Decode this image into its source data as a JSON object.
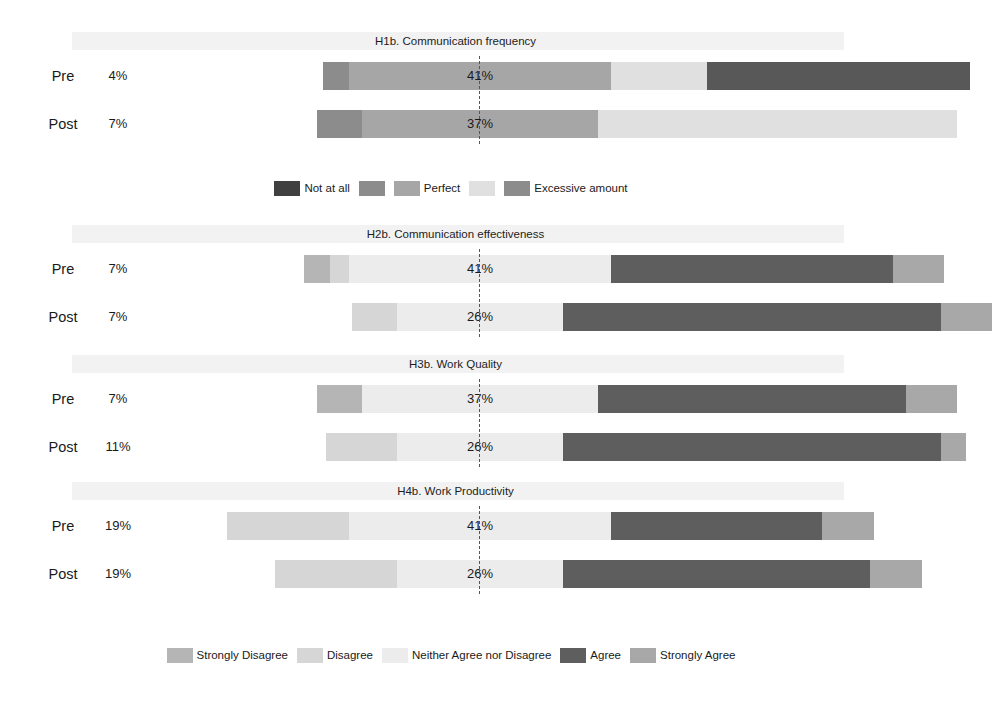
{
  "chart_data": {
    "type": "bar",
    "subtype": "diverging-stacked-likert",
    "title": "",
    "xlabel": "",
    "ylabel": "",
    "grid": false,
    "center_reference": 0,
    "legend_position": "bottom",
    "panels": [
      {
        "title": "H1b. Communication frequency",
        "scale": [
          "Not at all",
          "",
          "Perfect",
          "",
          "Excessive amount"
        ],
        "rows": [
          {
            "label": "Pre",
            "left_total": "4%",
            "right_total": "56%",
            "center_label": "41%",
            "values": [
              0,
              4,
              41,
              15,
              41
            ],
            "segments": [
              {
                "name": "Not at all",
                "value": 0
              },
              {
                "name": "seg2",
                "value": 4
              },
              {
                "name": "Perfect",
                "value": 41
              },
              {
                "name": "seg4",
                "value": 15
              },
              {
                "name": "Excessive amount",
                "value": 41
              }
            ]
          },
          {
            "label": "Post",
            "left_total": "7%",
            "right_total": "56%",
            "center_label": "37%",
            "values": [
              0,
              7,
              37,
              56,
              0
            ],
            "segments": [
              {
                "name": "Not at all",
                "value": 0
              },
              {
                "name": "seg2",
                "value": 7
              },
              {
                "name": "Perfect",
                "value": 37
              },
              {
                "name": "seg4",
                "value": 56
              },
              {
                "name": "Excessive amount",
                "value": 0
              }
            ]
          }
        ]
      },
      {
        "title": "H2b. Communication effectiveness",
        "scale": [
          "Strongly Disagree",
          "Disagree",
          "Neither Agree nor Disagree",
          "Agree",
          "Strongly Agree"
        ],
        "rows": [
          {
            "label": "Pre",
            "left_total": "7%",
            "right_total": "52%",
            "center_label": "41%",
            "values": [
              4,
              3,
              41,
              44,
              8
            ],
            "segments": [
              {
                "name": "Strongly Disagree",
                "value": 4
              },
              {
                "name": "Disagree",
                "value": 3
              },
              {
                "name": "Neither Agree nor Disagree",
                "value": 41
              },
              {
                "name": "Agree",
                "value": 44
              },
              {
                "name": "Strongly Agree",
                "value": 8
              }
            ]
          },
          {
            "label": "Post",
            "left_total": "7%",
            "right_total": "67%",
            "center_label": "26%",
            "values": [
              0,
              7,
              26,
              59,
              8
            ],
            "segments": [
              {
                "name": "Strongly Disagree",
                "value": 0
              },
              {
                "name": "Disagree",
                "value": 7
              },
              {
                "name": "Neither Agree nor Disagree",
                "value": 26
              },
              {
                "name": "Agree",
                "value": 59
              },
              {
                "name": "Strongly Agree",
                "value": 8
              }
            ]
          }
        ]
      },
      {
        "title": "H3b. Work Quality",
        "scale": [
          "Strongly Disagree",
          "Disagree",
          "Neither Agree nor Disagree",
          "Agree",
          "Strongly Agree"
        ],
        "rows": [
          {
            "label": "Pre",
            "left_total": "7%",
            "right_total": "56%",
            "center_label": "37%",
            "values": [
              7,
              0,
              37,
              48,
              8
            ],
            "segments": [
              {
                "name": "Strongly Disagree",
                "value": 7
              },
              {
                "name": "Disagree",
                "value": 0
              },
              {
                "name": "Neither Agree nor Disagree",
                "value": 37
              },
              {
                "name": "Agree",
                "value": 48
              },
              {
                "name": "Strongly Agree",
                "value": 8
              }
            ]
          },
          {
            "label": "Post",
            "left_total": "11%",
            "right_total": "63%",
            "center_label": "26%",
            "values": [
              0,
              11,
              26,
              59,
              4
            ],
            "segments": [
              {
                "name": "Strongly Disagree",
                "value": 0
              },
              {
                "name": "Disagree",
                "value": 11
              },
              {
                "name": "Neither Agree nor Disagree",
                "value": 26
              },
              {
                "name": "Agree",
                "value": 59
              },
              {
                "name": "Strongly Agree",
                "value": 4
              }
            ]
          }
        ]
      },
      {
        "title": "H4b. Work Productivity",
        "scale": [
          "Strongly Disagree",
          "Disagree",
          "Neither Agree nor Disagree",
          "Agree",
          "Strongly Agree"
        ],
        "rows": [
          {
            "label": "Pre",
            "left_total": "19%",
            "right_total": "41%",
            "center_label": "41%",
            "values": [
              0,
              19,
              41,
              33,
              8
            ],
            "segments": [
              {
                "name": "Strongly Disagree",
                "value": 0
              },
              {
                "name": "Disagree",
                "value": 19
              },
              {
                "name": "Neither Agree nor Disagree",
                "value": 41
              },
              {
                "name": "Agree",
                "value": 33
              },
              {
                "name": "Strongly Agree",
                "value": 8
              }
            ]
          },
          {
            "label": "Post",
            "left_total": "19%",
            "right_total": "56%",
            "center_label": "26%",
            "values": [
              0,
              19,
              26,
              48,
              8
            ],
            "segments": [
              {
                "name": "Strongly Disagree",
                "value": 0
              },
              {
                "name": "Disagree",
                "value": 19
              },
              {
                "name": "Neither Agree nor Disagree",
                "value": 26
              },
              {
                "name": "Agree",
                "value": 48
              },
              {
                "name": "Strongly Agree",
                "value": 8
              }
            ]
          }
        ]
      }
    ],
    "legends": [
      {
        "id": "frequency-legend",
        "entries": [
          {
            "label": "Not at all",
            "color": "#404040"
          },
          {
            "label": "",
            "color": "#8c8c8c"
          },
          {
            "label": "Perfect",
            "color": "#a6a6a6"
          },
          {
            "label": "",
            "color": "#e0e0e0"
          },
          {
            "label": "Excessive amount",
            "color": "#8c8c8c"
          }
        ]
      },
      {
        "id": "likert-legend",
        "entries": [
          {
            "label": "Strongly Disagree",
            "color": "#b5b5b5"
          },
          {
            "label": "Disagree",
            "color": "#d6d6d6"
          },
          {
            "label": "Neither Agree nor Disagree",
            "color": "#ececec"
          },
          {
            "label": "Agree",
            "color": "#5e5e5e"
          },
          {
            "label": "Strongly Agree",
            "color": "#a8a8a8"
          }
        ]
      }
    ],
    "colors": {
      "freq_1": "#404040",
      "freq_2": "#8c8c8c",
      "freq_3": "#a6a6a6",
      "freq_4": "#e0e0e0",
      "freq_5": "#585858",
      "likert_1": "#b5b5b5",
      "likert_2": "#d6d6d6",
      "likert_3": "#ececec",
      "likert_4": "#5e5e5e",
      "likert_5": "#a8a8a8",
      "band": "#f2f2f2",
      "text": "#1a1a1a",
      "centerline": "#555555"
    }
  }
}
